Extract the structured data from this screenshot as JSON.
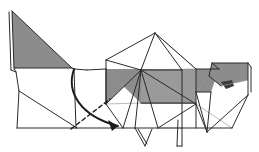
{
  "document": {
    "type": "origami-folding-diagram",
    "title": "",
    "caption": "",
    "subject": "folded paper animal figure",
    "background_color": "#ffffff"
  },
  "palette": {
    "paper_front": "#ffffff",
    "paper_back_shade": "#8c8c8c",
    "paper_back_shade_light": "#9a9a9a",
    "paper_back_shade_dark": "#6e6e6e",
    "detail_dark": "#3a3a3a",
    "line_color": "#2b2b2b",
    "line_color_soft": "#9b9b9b",
    "arrow_color": "#1a1a1a"
  },
  "canvas": {
    "width": 259,
    "height": 152,
    "viewbox": "0 0 259 152"
  },
  "shapes": {
    "tail_panel": {
      "name": "tail-shaded-triangle",
      "fill": "#8c8c8c",
      "points": "12,11 14,68 72,68"
    },
    "tail_under_sliver": {
      "name": "tail-under-sliver",
      "fill": "#b9b9b9",
      "points": "12,11 14,68 16,70 13,12"
    },
    "body_band": {
      "name": "body-shaded-band",
      "fill": "#8c8c8c",
      "points": "106,69 195,69 195,103 141,103"
    },
    "body_wedge_left": {
      "name": "body-shaded-left-wedge",
      "fill": "#8c8c8c",
      "points": "106,69 141,70 106,104"
    },
    "body_wedge_right": {
      "name": "body-shaded-right-wedge",
      "fill": "#9a9a9a",
      "points": "141,70 196,70 196,104 141,104"
    },
    "neck_panel": {
      "name": "neck-shaded-triangle",
      "fill": "#8c8c8c",
      "points": "196,69 219,69 211,92 196,92"
    },
    "head_panel": {
      "name": "head-shaded-trapezoid",
      "fill": "#8c8c8c",
      "points": "212,63 248,63 248,80 221,86 209,76"
    },
    "snout_detail": {
      "name": "snout-dark-detail",
      "fill": "#3a3a3a",
      "points": "221,82 232,80 234,86 226,89"
    }
  },
  "creases": {
    "valley_mountain_lines": [
      "12,11 14,68",
      "12,11 72,68",
      "14,68 72,68",
      "9,12 11,70",
      "11,70 16,72",
      "16,72 19,91",
      "14,69 16,72",
      "19,91 17,128",
      "19,91 77,128",
      "17,128 232,128",
      "72,68 74,69",
      "74,69 87,70",
      "87,70 106,69",
      "74,69 76,128",
      "106,69 106,104",
      "106,60 106,104",
      "106,60 155,33",
      "106,60 141,70",
      "155,33 141,70",
      "155,33 196,69",
      "155,33 182,70",
      "141,70 106,104",
      "141,70 123,128",
      "141,70 135,128",
      "141,70 158,128",
      "141,70 182,70",
      "141,70 196,104",
      "106,104 123,128",
      "141,103 196,103",
      "182,70 182,128",
      "158,128 196,104",
      "196,69 196,128",
      "196,69 219,69",
      "219,69 212,63",
      "212,63 248,63",
      "248,63 248,95",
      "248,63 251,67",
      "251,67 251,92",
      "209,76 221,86",
      "212,63 209,76",
      "196,92 211,92",
      "196,92 207,132",
      "211,92 207,132",
      "207,132 248,95",
      "196,104 207,132",
      "135,128 145,146",
      "145,146 152,129",
      "138,129 147,144",
      "178,120 177,146",
      "177,146 182,146",
      "182,146 182,128",
      "232,128 248,95"
    ],
    "soft_lines": [
      "106,69 141,103",
      "141,70 196,69",
      "155,33 196,69",
      "196,104 232,128",
      "106,104 141,103",
      "182,70 196,104",
      "158,128 182,128",
      "221,86 248,80",
      "209,76 196,92"
    ]
  },
  "arrow": {
    "name": "fold-direction-arrow",
    "type": "curved-fold-arrow",
    "path": "M 74,69 C 66,92 80,116 118,126",
    "head": "118,126 108,120 112,131",
    "color": "#1a1a1a"
  },
  "dashed_guide": {
    "name": "hidden-edge-dashed-line",
    "path": "M 71,129 L 110,99",
    "dash_pattern": "4 3",
    "color": "#1a1a1a"
  },
  "labels": {
    "step_number": "",
    "annotation": ""
  }
}
